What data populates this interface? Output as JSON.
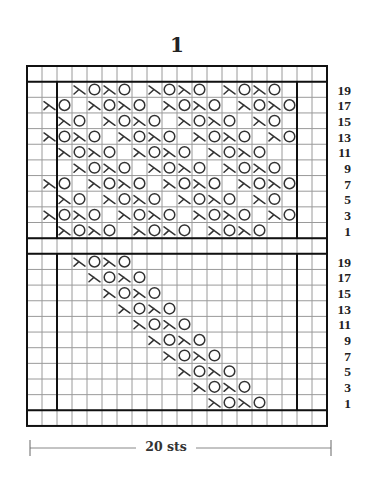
{
  "title": "1",
  "grid": {
    "left": 27,
    "top": 66,
    "col_width": 15,
    "row_height": 15.65,
    "cols": 20,
    "inner_left_col": 2,
    "inner_right_col": 18,
    "line_color_thin": "#9a9a9a",
    "line_color_thick": "#111111"
  },
  "symbols": {
    "k2tog": "lambda-decrease",
    "yo": "circle-yarn-over"
  },
  "charts": [
    {
      "name": "top-chart",
      "row_labels": [
        "19",
        "17",
        "15",
        "13",
        "11",
        "9",
        "7",
        "5",
        "3",
        "1"
      ],
      "rows": [
        {
          "label": "19",
          "k2tog": [
            3,
            5,
            8,
            10,
            13,
            15
          ],
          "yo": [
            4,
            6,
            9,
            11,
            14,
            16
          ]
        },
        {
          "label": "17",
          "k2tog": [
            1,
            4,
            6,
            9,
            11,
            14,
            16
          ],
          "yo": [
            2,
            5,
            7,
            10,
            12,
            15,
            17
          ]
        },
        {
          "label": "15",
          "k2tog": [
            2,
            5,
            7,
            10,
            12,
            15
          ],
          "yo": [
            3,
            6,
            8,
            11,
            13,
            16
          ]
        },
        {
          "label": "13",
          "k2tog": [
            1,
            3,
            6,
            8,
            11,
            13,
            16
          ],
          "yo": [
            2,
            4,
            7,
            9,
            12,
            14,
            17
          ]
        },
        {
          "label": "11",
          "k2tog": [
            2,
            4,
            7,
            9,
            12,
            14
          ],
          "yo": [
            3,
            5,
            8,
            10,
            13,
            15
          ]
        },
        {
          "label": "9",
          "k2tog": [
            3,
            5,
            8,
            10,
            13,
            15
          ],
          "yo": [
            4,
            6,
            9,
            11,
            14,
            16
          ]
        },
        {
          "label": "7",
          "k2tog": [
            1,
            4,
            6,
            9,
            11,
            14,
            16
          ],
          "yo": [
            2,
            5,
            7,
            10,
            12,
            15,
            17
          ]
        },
        {
          "label": "5",
          "k2tog": [
            2,
            5,
            7,
            10,
            12,
            15
          ],
          "yo": [
            3,
            6,
            8,
            11,
            13,
            16
          ]
        },
        {
          "label": "3",
          "k2tog": [
            1,
            3,
            6,
            8,
            11,
            13,
            16
          ],
          "yo": [
            2,
            4,
            7,
            9,
            12,
            14,
            17
          ]
        },
        {
          "label": "1",
          "k2tog": [
            2,
            4,
            7,
            9,
            12,
            14
          ],
          "yo": [
            3,
            5,
            8,
            10,
            13,
            15
          ]
        }
      ]
    },
    {
      "name": "bottom-chart",
      "row_labels": [
        "19",
        "17",
        "15",
        "13",
        "11",
        "9",
        "7",
        "5",
        "3",
        "1"
      ],
      "rows": [
        {
          "label": "19",
          "k2tog": [
            3,
            5
          ],
          "yo": [
            4,
            6
          ]
        },
        {
          "label": "17",
          "k2tog": [
            4,
            6
          ],
          "yo": [
            5,
            7
          ]
        },
        {
          "label": "15",
          "k2tog": [
            5,
            7
          ],
          "yo": [
            6,
            8
          ]
        },
        {
          "label": "13",
          "k2tog": [
            6,
            8
          ],
          "yo": [
            7,
            9
          ]
        },
        {
          "label": "11",
          "k2tog": [
            7,
            9
          ],
          "yo": [
            8,
            10
          ]
        },
        {
          "label": "9",
          "k2tog": [
            8,
            10
          ],
          "yo": [
            9,
            11
          ]
        },
        {
          "label": "7",
          "k2tog": [
            9,
            11
          ],
          "yo": [
            10,
            12
          ]
        },
        {
          "label": "5",
          "k2tog": [
            10,
            12
          ],
          "yo": [
            11,
            13
          ]
        },
        {
          "label": "3",
          "k2tog": [
            11,
            13
          ],
          "yo": [
            12,
            14
          ]
        },
        {
          "label": "1",
          "k2tog": [
            12,
            14
          ],
          "yo": [
            13,
            15
          ]
        }
      ]
    }
  ],
  "dimension": {
    "label": "20 sts",
    "x1": 30,
    "x2": 331,
    "y": 448
  }
}
